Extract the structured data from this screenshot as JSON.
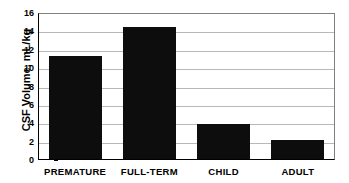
{
  "chart_data": {
    "type": "bar",
    "title": "",
    "xlabel": "",
    "ylabel": "CSF Volume, mL/kg",
    "categories": [
      "PREMATURE",
      "FULL-TERM",
      "CHILD",
      "ADULT"
    ],
    "values": [
      11.4,
      14.6,
      3.9,
      2.1
    ],
    "ylim": [
      0,
      16
    ],
    "ytick_values": [
      0,
      2,
      4,
      6,
      8,
      10,
      12,
      14,
      16
    ],
    "ytick_labels": [
      "0",
      "2",
      "4",
      "6",
      "8",
      "10",
      "12",
      "14",
      "16"
    ],
    "grid": true,
    "legend": false,
    "legend_position": "none",
    "bar_color": "#0d0d0d",
    "gridline_color": "#b8b8b8",
    "axis_color": "#000000",
    "background_color": "#ffffff"
  }
}
